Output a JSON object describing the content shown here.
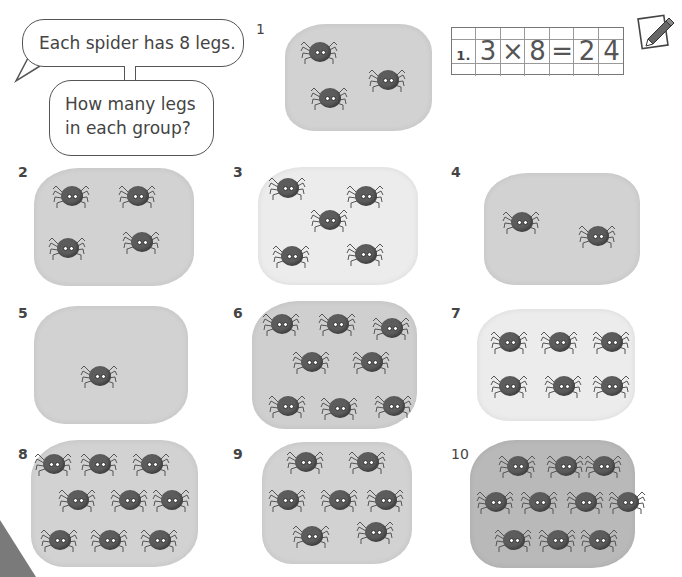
{
  "speech_bubbles": {
    "statement": "Each spider has 8 legs.",
    "question_line1": "How many legs",
    "question_line2": "in each group?"
  },
  "example_answer": {
    "label": "1.",
    "cells": [
      "3",
      "×",
      "8",
      "=",
      "2",
      "4"
    ]
  },
  "groups": [
    {
      "number": "1",
      "spiders": 3
    },
    {
      "number": "2",
      "spiders": 4
    },
    {
      "number": "3",
      "spiders": 5
    },
    {
      "number": "4",
      "spiders": 2
    },
    {
      "number": "5",
      "spiders": 1
    },
    {
      "number": "6",
      "spiders": 8
    },
    {
      "number": "7",
      "spiders": 6
    },
    {
      "number": "8",
      "spiders": 9
    },
    {
      "number": "9",
      "spiders": 8
    },
    {
      "number": "10",
      "spiders": 10
    }
  ],
  "icons": {
    "pencil": "pencil-notepad-icon"
  },
  "colors": {
    "blob_gray": "#d2d2d2",
    "blob_light": "#ececec",
    "spider_body": "#5c5c5c",
    "text": "#444444"
  }
}
